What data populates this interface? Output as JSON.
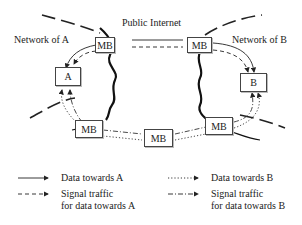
{
  "diagram": {
    "labels": {
      "public_internet": "Public Internet",
      "network_a": "Network of A",
      "network_b": "Network of B"
    },
    "nodes": {
      "host_a": "A",
      "host_b": "B",
      "mb_top_left": "MB",
      "mb_top_right": "MB",
      "mb_bottom_left": "MB",
      "mb_bottom_middle": "MB",
      "mb_bottom_right": "MB"
    },
    "legend": [
      {
        "style": "solid",
        "label": "Data towards A"
      },
      {
        "style": "dotted",
        "label": "Data towards B"
      },
      {
        "style": "dashed",
        "label_line1": "Signal traffic",
        "label_line2": "for data towards A"
      },
      {
        "style": "dash-dot",
        "label_line1": "Signal traffic",
        "label_line2": "for data towards B"
      }
    ],
    "colors": {
      "line": "#222222",
      "box_border": "#444444",
      "background": "#ffffff"
    }
  }
}
